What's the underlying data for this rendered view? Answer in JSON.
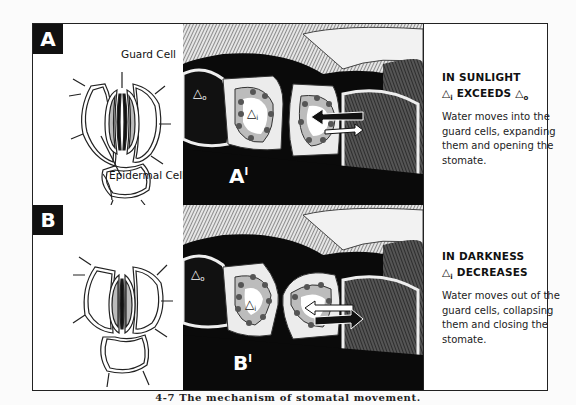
{
  "figure": {
    "caption": "4-7   The mechanism of stomatal movement."
  },
  "panels": [
    {
      "id": "A",
      "badge": "A",
      "detail_label": "A'",
      "labels": {
        "guard_cell": "Guard Cell",
        "epidermal_cell": "Epidermal Cell"
      },
      "delta_outside": "Δo",
      "delta_inside": "Δi",
      "arrow_direction": "into guard cell",
      "condition": "IN SUNLIGHT",
      "relation": "Δi EXCEEDS Δo",
      "description": "Water moves into the guard cells, expanding them and opening the stomate."
    },
    {
      "id": "B",
      "badge": "B",
      "detail_label": "B'",
      "delta_outside": "Δo",
      "delta_inside": "Δi",
      "arrow_direction": "out of guard cell",
      "condition": "IN DARKNESS",
      "relation": "Δi DECREASES",
      "description": "Water moves out of the guard cells, collapsing them and closing the stomate."
    }
  ],
  "text": {
    "a_condition": "IN SUNLIGHT",
    "a_relation_1": "△",
    "a_relation_sub": "i",
    "a_relation_2": " EXCEEDS ",
    "a_relation_3": "△",
    "a_relation_sub2": "o",
    "a_desc": "Water moves into the guard cells, expanding them and opening the stomate.",
    "b_condition": "IN DARKNESS",
    "b_relation_1": "△",
    "b_relation_sub": "i",
    "b_relation_2": " DECREASES",
    "b_desc": "Water moves out of the guard cells, collapsing them and closing the stomate.",
    "guard_cell": "Guard Cell",
    "epidermal_cell": "Epidermal Cell",
    "badge_a": "A",
    "badge_b": "B",
    "detail_a": "A",
    "detail_b": "B",
    "prime": "I",
    "delta_o": "△",
    "delta_o_sub": "o",
    "delta_i": "△",
    "delta_i_sub": "i"
  }
}
